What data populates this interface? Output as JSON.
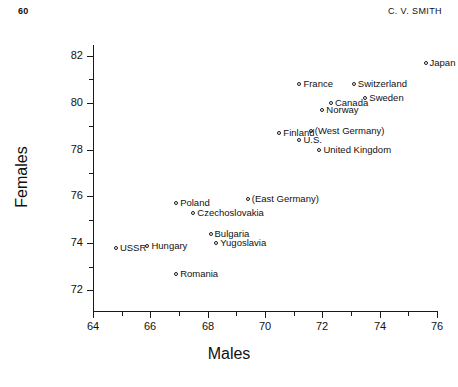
{
  "page": {
    "folio": "60",
    "running_head": "C. V. SMITH"
  },
  "chart_data": {
    "type": "scatter",
    "title": "",
    "xlabel": "Males",
    "ylabel": "Females",
    "xlim": [
      64,
      77
    ],
    "ylim": [
      71,
      82.6
    ],
    "grid": false,
    "legend": null,
    "xticks": [
      64,
      66,
      68,
      70,
      72,
      74,
      76
    ],
    "xtick_labels": [
      "64",
      "66",
      "68",
      "70",
      "72",
      "74",
      "76"
    ],
    "xticks_minor": [
      65,
      67,
      69,
      71,
      73,
      75
    ],
    "yticks": [
      72,
      74,
      76,
      78,
      80,
      82
    ],
    "ytick_labels": [
      "72",
      "74",
      "76",
      "78",
      "80",
      "82"
    ],
    "yticks_minor": [
      73,
      75,
      77,
      79,
      81
    ],
    "marker": "open-circle",
    "points": [
      {
        "label": "Japan",
        "x": 75.6,
        "y": 81.7,
        "label_pos": "right"
      },
      {
        "label": "Switzerland",
        "x": 73.1,
        "y": 80.8,
        "label_pos": "right"
      },
      {
        "label": "France",
        "x": 71.2,
        "y": 80.8,
        "label_pos": "right"
      },
      {
        "label": "Sweden",
        "x": 73.5,
        "y": 80.2,
        "label_pos": "right"
      },
      {
        "label": "Canada",
        "x": 72.3,
        "y": 80.0,
        "label_pos": "right"
      },
      {
        "label": "Norway",
        "x": 72.0,
        "y": 79.7,
        "label_pos": "right"
      },
      {
        "label": "(West Germany)",
        "x": 71.6,
        "y": 78.8,
        "label_pos": "right"
      },
      {
        "label": "Finland",
        "x": 70.5,
        "y": 78.7,
        "label_pos": "right"
      },
      {
        "label": "U.S.",
        "x": 71.2,
        "y": 78.4,
        "label_pos": "right"
      },
      {
        "label": "United Kingdom",
        "x": 71.9,
        "y": 78.0,
        "label_pos": "right"
      },
      {
        "label": "(East Germany)",
        "x": 69.4,
        "y": 75.9,
        "label_pos": "right"
      },
      {
        "label": "Poland",
        "x": 66.9,
        "y": 75.7,
        "label_pos": "right"
      },
      {
        "label": "Czechoslovakia",
        "x": 67.5,
        "y": 75.3,
        "label_pos": "right"
      },
      {
        "label": "Bulgaria",
        "x": 68.1,
        "y": 74.4,
        "label_pos": "right"
      },
      {
        "label": "Yugoslavia",
        "x": 68.3,
        "y": 74.0,
        "label_pos": "right"
      },
      {
        "label": "Hungary",
        "x": 65.9,
        "y": 73.9,
        "label_pos": "right"
      },
      {
        "label": "USSR",
        "x": 64.8,
        "y": 73.8,
        "label_pos": "right"
      },
      {
        "label": "Romania",
        "x": 66.9,
        "y": 72.7,
        "label_pos": "right"
      }
    ]
  }
}
